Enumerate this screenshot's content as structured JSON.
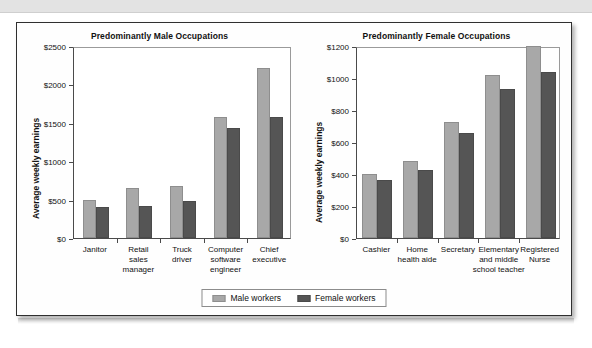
{
  "page": {
    "background_color": "#ffffff",
    "panel_border_color": "#2f2f2f"
  },
  "legend": {
    "items": [
      {
        "label": "Male workers",
        "color": "#a8a8a8",
        "swatch_name": "male-swatch"
      },
      {
        "label": "Female workers",
        "color": "#555555",
        "swatch_name": "female-swatch"
      }
    ]
  },
  "chart_data": [
    {
      "type": "bar",
      "title": "Predominantly Male Occupations",
      "xlabel": "",
      "ylabel": "Average weekly earnings",
      "ylim": [
        0,
        2500
      ],
      "ytick_values": [
        0,
        500,
        1000,
        1500,
        2000,
        2500
      ],
      "ytick_labels": [
        "$0",
        "$500",
        "$1000",
        "$1500",
        "$2000",
        "$2500"
      ],
      "grid": false,
      "legend_position": "bottom-center-shared",
      "categories": [
        "Janitor",
        "Retail\nsales\nmanager",
        "Truck\ndriver",
        "Computer\nsoftware\nengineer",
        "Chief\nexecutive"
      ],
      "series": [
        {
          "name": "Male workers",
          "color": "#a8a8a8",
          "values": [
            490,
            650,
            680,
            1570,
            2215
          ]
        },
        {
          "name": "Female workers",
          "color": "#555555",
          "values": [
            400,
            415,
            480,
            1430,
            1580
          ]
        }
      ]
    },
    {
      "type": "bar",
      "title": "Predominantly Female Occupations",
      "xlabel": "",
      "ylabel": "Average weekly earnings",
      "ylim": [
        0,
        1200
      ],
      "ytick_values": [
        0,
        200,
        400,
        600,
        800,
        1000,
        1200
      ],
      "ytick_labels": [
        "$0",
        "$200",
        "$400",
        "$600",
        "$800",
        "$1000",
        "$1200"
      ],
      "grid": false,
      "legend_position": "bottom-center-shared",
      "categories": [
        "Cashier",
        "Home\nhealth aide",
        "Secretary",
        "Elementary\nand middle\nschool teacher",
        "Registered\nNurse"
      ],
      "series": [
        {
          "name": "Male workers",
          "color": "#a8a8a8",
          "values": [
            398,
            483,
            725,
            1018,
            1200
          ]
        },
        {
          "name": "Female workers",
          "color": "#555555",
          "values": [
            362,
            423,
            657,
            930,
            1038
          ]
        }
      ]
    }
  ]
}
